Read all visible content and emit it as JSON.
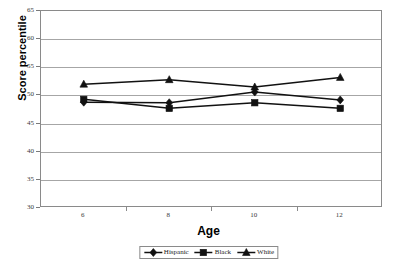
{
  "chart_data": {
    "type": "line",
    "title": "",
    "xlabel": "Age",
    "ylabel": "Score percentile",
    "x": [
      6,
      8,
      10,
      12
    ],
    "categories": [
      "6",
      "8",
      "10",
      "12"
    ],
    "xlim": [
      5,
      13
    ],
    "ylim": [
      30,
      65
    ],
    "y_ticks": [
      30,
      35,
      40,
      45,
      50,
      55,
      60,
      65
    ],
    "x_ticks": [
      "6",
      "8",
      "10",
      "12"
    ],
    "grid": "horizontal",
    "legend_position": "bottom",
    "series": [
      {
        "name": "Hispanic",
        "marker": "diamond",
        "color": "#1a1a1a",
        "values": [
          48.8,
          48.7,
          50.6,
          49.2
        ]
      },
      {
        "name": "Black",
        "marker": "square",
        "color": "#1a1a1a",
        "values": [
          49.3,
          47.7,
          48.7,
          47.7
        ]
      },
      {
        "name": "White",
        "marker": "triangle",
        "color": "#1a1a1a",
        "values": [
          52.0,
          52.8,
          51.5,
          53.2
        ]
      }
    ]
  },
  "axes": {
    "y_title": "Score percentile",
    "x_title": "Age",
    "y_tick_labels": [
      "65",
      "60",
      "55",
      "50",
      "45",
      "40",
      "35",
      "30"
    ],
    "x_tick_labels": [
      "6",
      "8",
      "10",
      "12"
    ]
  },
  "legend": {
    "items": [
      {
        "label": "Hispanic"
      },
      {
        "label": "Black"
      },
      {
        "label": "White"
      }
    ]
  },
  "colors": {
    "series": "#1a1a1a",
    "gridline": "#a6a6a6",
    "axis": "#8a8a8a",
    "background": "#ffffff"
  }
}
